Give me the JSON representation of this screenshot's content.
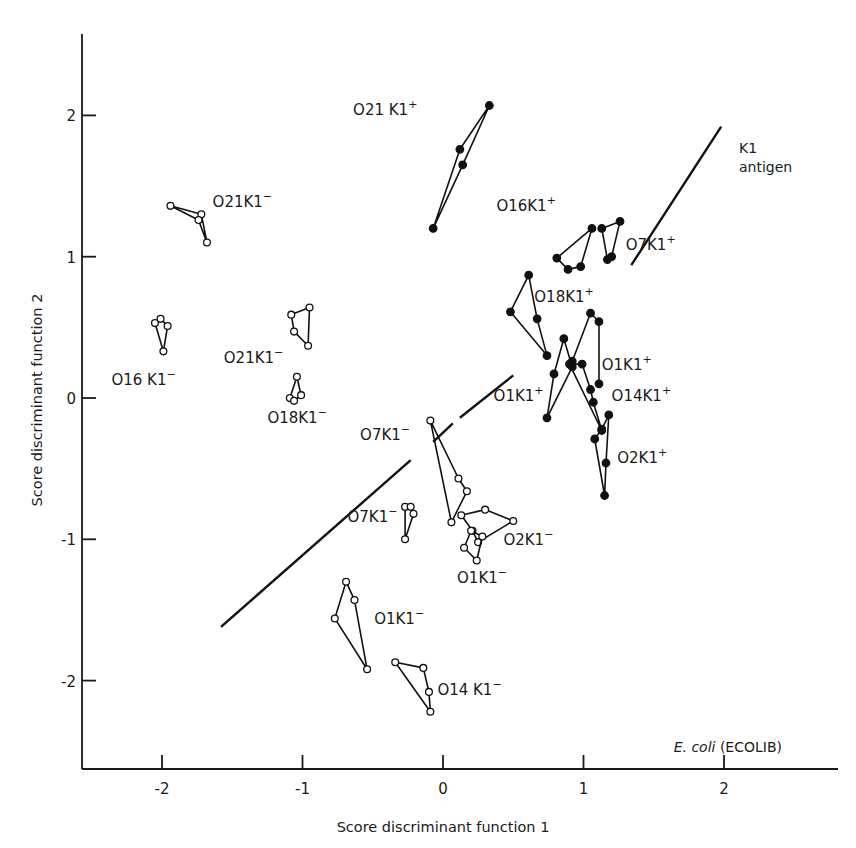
{
  "chart_data": {
    "type": "scatter",
    "title": "",
    "xlabel": "Score discriminant function 1",
    "ylabel": "Score discriminant function 2",
    "xlim": [
      -2.6,
      2.8
    ],
    "ylim": [
      -2.6,
      2.55
    ],
    "xticks": [
      -2,
      -1,
      0,
      1,
      2
    ],
    "yticks": [
      -2,
      -1,
      0,
      1,
      2
    ],
    "xtick_labels": [
      "-2",
      "-1",
      "0",
      "1",
      "2"
    ],
    "ytick_labels": [
      "-2",
      "-1",
      "0",
      "1",
      "2"
    ],
    "grid": false,
    "legend": null,
    "annotation": {
      "italic": "E. coli",
      "plain": " (ECOLIB)"
    },
    "separator_line": {
      "label_line1": "K1",
      "label_line2": "antigen",
      "segments": [
        [
          [
            -1.58,
            -1.62
          ],
          [
            -0.23,
            -0.44
          ]
        ],
        [
          [
            -0.07,
            -0.31
          ],
          [
            0.07,
            -0.18
          ]
        ],
        [
          [
            0.12,
            -0.14
          ],
          [
            0.5,
            0.16
          ]
        ],
        [
          [
            1.34,
            0.94
          ],
          [
            1.98,
            1.92
          ]
        ]
      ]
    },
    "markers": {
      "open": "K1- (K1 antigen negative)",
      "filled": "K1+ (K1 antigen positive)"
    },
    "series": [
      {
        "name": "O21K1+",
        "label_main": "O21 K1",
        "sup": "+",
        "filled": true,
        "points": [
          [
            0.33,
            2.07
          ],
          [
            0.12,
            1.76
          ],
          [
            0.14,
            1.65
          ],
          [
            -0.07,
            1.2
          ]
        ],
        "path": [
          3,
          1,
          0,
          2,
          3
        ],
        "label_pos": [
          -0.64,
          2.0
        ]
      },
      {
        "name": "O16K1+",
        "label_main": "O16K1",
        "sup": "+",
        "filled": true,
        "points": [
          [
            0.81,
            0.99
          ],
          [
            0.89,
            0.91
          ],
          [
            0.98,
            0.93
          ],
          [
            1.06,
            1.2
          ]
        ],
        "path": [
          0,
          1,
          2,
          3,
          0
        ],
        "label_pos": [
          0.38,
          1.32
        ]
      },
      {
        "name": "O7K1+",
        "label_main": "O7K1",
        "sup": "+",
        "filled": true,
        "points": [
          [
            1.13,
            1.2
          ],
          [
            1.26,
            1.25
          ],
          [
            1.17,
            0.98
          ],
          [
            1.2,
            1.0
          ]
        ],
        "path": [
          0,
          1,
          3,
          2,
          0
        ],
        "label_pos": [
          1.3,
          1.05
        ]
      },
      {
        "name": "O18K1+",
        "label_main": "O18K1",
        "sup": "+",
        "filled": true,
        "points": [
          [
            0.61,
            0.87
          ],
          [
            0.48,
            0.61
          ],
          [
            0.67,
            0.56
          ],
          [
            0.74,
            0.3
          ]
        ],
        "path": [
          0,
          2,
          3,
          1,
          0
        ],
        "label_pos": [
          0.65,
          0.68
        ]
      },
      {
        "name": "O1K1+ (upper)",
        "label_main": "O1K1",
        "sup": "+",
        "filled": true,
        "points": [
          [
            1.05,
            0.6
          ],
          [
            1.11,
            0.54
          ],
          [
            1.11,
            0.1
          ],
          [
            0.92,
            0.26
          ]
        ],
        "path": [
          3,
          0,
          1,
          2
        ],
        "label_pos": [
          1.13,
          0.2
        ]
      },
      {
        "name": "O1K1+ (lower)",
        "label_main": "O1K1",
        "sup": "+",
        "filled": true,
        "points": [
          [
            0.86,
            0.42
          ],
          [
            0.79,
            0.17
          ],
          [
            0.74,
            -0.14
          ],
          [
            0.92,
            0.22
          ]
        ],
        "path": [
          0,
          1,
          2,
          3,
          0
        ],
        "label_pos": [
          0.36,
          -0.02
        ]
      },
      {
        "name": "O14K1+",
        "label_main": "O14K1",
        "sup": "+",
        "filled": true,
        "points": [
          [
            0.9,
            0.24
          ],
          [
            0.99,
            0.24
          ],
          [
            1.05,
            0.06
          ],
          [
            1.07,
            -0.03
          ],
          [
            1.13,
            -0.23
          ]
        ],
        "path": [
          0,
          1,
          2,
          3,
          4,
          0
        ],
        "label_pos": [
          1.2,
          -0.02
        ]
      },
      {
        "name": "O2K1+",
        "label_main": "O2K1",
        "sup": "+",
        "filled": true,
        "points": [
          [
            1.13,
            -0.22
          ],
          [
            1.18,
            -0.12
          ],
          [
            1.08,
            -0.29
          ],
          [
            1.16,
            -0.46
          ],
          [
            1.15,
            -0.69
          ]
        ],
        "path": [
          1,
          3,
          4,
          2,
          0,
          1
        ],
        "label_pos": [
          1.24,
          -0.46
        ]
      },
      {
        "name": "O21K1- (upper)",
        "label_main": "O21K1",
        "sup": "−",
        "filled": false,
        "points": [
          [
            -1.94,
            1.36
          ],
          [
            -1.72,
            1.3
          ],
          [
            -1.74,
            1.26
          ],
          [
            -1.68,
            1.1
          ]
        ],
        "path": [
          0,
          1,
          3,
          2,
          0
        ],
        "label_pos": [
          -1.64,
          1.35
        ]
      },
      {
        "name": "O21K1- (middle)",
        "label_main": "O21K1",
        "sup": "−",
        "filled": false,
        "points": [
          [
            -1.08,
            0.59
          ],
          [
            -0.95,
            0.64
          ],
          [
            -1.06,
            0.47
          ],
          [
            -0.96,
            0.37
          ]
        ],
        "path": [
          0,
          1,
          3,
          2,
          0
        ],
        "label_pos": [
          -1.56,
          0.25
        ]
      },
      {
        "name": "O16K1-",
        "label_main": "O16 K1",
        "sup": "−",
        "filled": false,
        "points": [
          [
            -2.05,
            0.53
          ],
          [
            -2.01,
            0.56
          ],
          [
            -1.96,
            0.51
          ],
          [
            -1.99,
            0.33
          ]
        ],
        "path": [
          0,
          1,
          2,
          3,
          0
        ],
        "label_pos": [
          -2.36,
          0.09
        ]
      },
      {
        "name": "O18K1-",
        "label_main": "O18K1",
        "sup": "−",
        "filled": false,
        "points": [
          [
            -1.04,
            0.15
          ],
          [
            -1.01,
            0.02
          ],
          [
            -1.09,
            0.0
          ],
          [
            -1.06,
            -0.02
          ]
        ],
        "path": [
          0,
          1,
          3,
          2,
          0
        ],
        "label_pos": [
          -1.25,
          -0.18
        ]
      },
      {
        "name": "O7K1- (upper)",
        "label_main": "O7K1",
        "sup": "−",
        "filled": false,
        "points": [
          [
            -0.09,
            -0.16
          ],
          [
            0.11,
            -0.57
          ],
          [
            0.17,
            -0.66
          ],
          [
            0.06,
            -0.88
          ]
        ],
        "path": [
          0,
          1,
          2,
          3,
          0
        ],
        "label_pos": [
          -0.59,
          -0.3
        ]
      },
      {
        "name": "O2K1-",
        "label_main": "O2K1",
        "sup": "−",
        "filled": false,
        "points": [
          [
            0.13,
            -0.83
          ],
          [
            0.3,
            -0.79
          ],
          [
            0.5,
            -0.87
          ],
          [
            0.25,
            -1.02
          ],
          [
            0.21,
            -0.94
          ]
        ],
        "path": [
          0,
          1,
          2,
          3,
          4,
          0
        ],
        "label_pos": [
          0.43,
          -1.04
        ]
      },
      {
        "name": "O1K1- (right)",
        "label_main": "O1K1",
        "sup": "−",
        "filled": false,
        "points": [
          [
            0.2,
            -0.94
          ],
          [
            0.28,
            -0.98
          ],
          [
            0.15,
            -1.06
          ],
          [
            0.24,
            -1.15
          ]
        ],
        "path": [
          0,
          1,
          3,
          2,
          0
        ],
        "label_pos": [
          0.1,
          -1.31
        ]
      },
      {
        "name": "O7K1- (lower)",
        "label_main": "O7K1",
        "sup": "−",
        "filled": false,
        "points": [
          [
            -0.27,
            -0.77
          ],
          [
            -0.23,
            -0.77
          ],
          [
            -0.21,
            -0.82
          ],
          [
            -0.27,
            -1.0
          ]
        ],
        "path": [
          0,
          1,
          2,
          3,
          0
        ],
        "label_pos": [
          -0.68,
          -0.88
        ]
      },
      {
        "name": "O1K1- (lower)",
        "label_main": "O1K1",
        "sup": "−",
        "filled": false,
        "points": [
          [
            -0.69,
            -1.3
          ],
          [
            -0.63,
            -1.43
          ],
          [
            -0.77,
            -1.56
          ],
          [
            -0.54,
            -1.92
          ]
        ],
        "path": [
          0,
          1,
          3,
          2,
          0
        ],
        "label_pos": [
          -0.49,
          -1.6
        ]
      },
      {
        "name": "O14K1-",
        "label_main": "O14 K1",
        "sup": "−",
        "filled": false,
        "points": [
          [
            -0.34,
            -1.87
          ],
          [
            -0.14,
            -1.91
          ],
          [
            -0.1,
            -2.08
          ],
          [
            -0.09,
            -2.22
          ]
        ],
        "path": [
          0,
          1,
          2,
          3,
          0
        ],
        "label_pos": [
          -0.04,
          -2.1
        ]
      }
    ]
  }
}
